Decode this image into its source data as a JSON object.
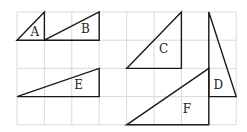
{
  "grid": {
    "cols": 8,
    "rows": 4,
    "origin_x": 17,
    "origin_y": 12,
    "cell_w": 27.4,
    "cell_h": 28.2,
    "line_color": "#d9d9d9"
  },
  "stroke_color": "#1a1a1a",
  "triangles": [
    {
      "label": "A",
      "points": [
        [
          0,
          1
        ],
        [
          1,
          0
        ],
        [
          1,
          1
        ]
      ],
      "label_pos": [
        0.65,
        0.72
      ]
    },
    {
      "label": "B",
      "points": [
        [
          1,
          1
        ],
        [
          3,
          0
        ],
        [
          3,
          1
        ]
      ],
      "label_pos": [
        2.5,
        0.62
      ]
    },
    {
      "label": "C",
      "points": [
        [
          4,
          2
        ],
        [
          6,
          0
        ],
        [
          6,
          2
        ]
      ],
      "label_pos": [
        5.35,
        1.3
      ]
    },
    {
      "label": "D",
      "points": [
        [
          7,
          0
        ],
        [
          7,
          3
        ],
        [
          8,
          3
        ]
      ],
      "label_pos": [
        7.35,
        2.6
      ]
    },
    {
      "label": "E",
      "points": [
        [
          0,
          3
        ],
        [
          3,
          2
        ],
        [
          3,
          3
        ]
      ],
      "label_pos": [
        2.25,
        2.6
      ]
    },
    {
      "label": "F",
      "points": [
        [
          4,
          4
        ],
        [
          7,
          2
        ],
        [
          7,
          4
        ]
      ],
      "label_pos": [
        6.2,
        3.45
      ]
    }
  ]
}
